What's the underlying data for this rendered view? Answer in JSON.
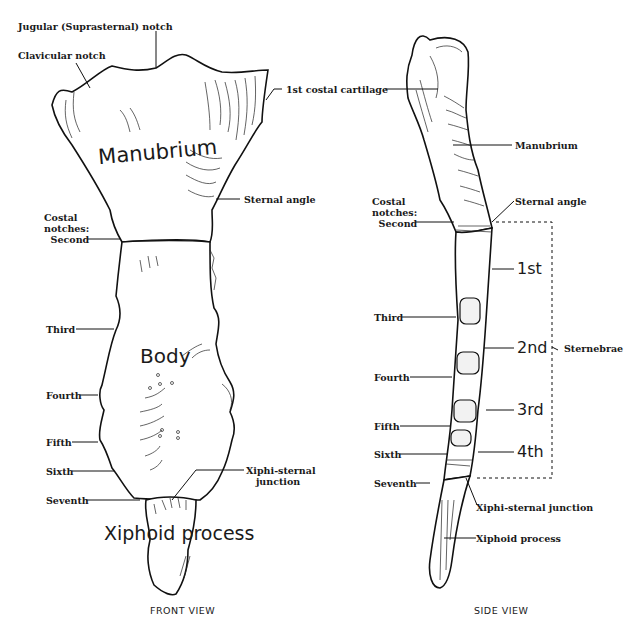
{
  "front_view": {
    "caption": "FRONT VIEW",
    "regions": {
      "manubrium": "Manubrium",
      "body": "Body",
      "xiphoid": "Xiphoid process"
    },
    "labels": {
      "jugular_notch": "Jugular (Suprasternal) notch",
      "clavicular_notch": "Clavicular notch",
      "first_costal_cartilage": "1st costal cartilage",
      "sternal_angle": "Sternal angle",
      "costal_notches": "Costal\nnotches:\n  Second",
      "third": "Third",
      "fourth": "Fourth",
      "fifth": "Fifth",
      "sixth": "Sixth",
      "seventh": "Seventh",
      "xiphisternal_junction": "Xiphi-sternal\n   junction"
    }
  },
  "side_view": {
    "caption": "SIDE VIEW",
    "labels": {
      "manubrium": "Manubrium",
      "sternal_angle": "Sternal angle",
      "costal_notches": "Costal\nnotches:\n  Second",
      "third": "Third",
      "fourth": "Fourth",
      "fifth": "Fifth",
      "sixth": "Sixth",
      "seventh": "Seventh",
      "xiphisternal_junction": "Xiphi-sternal junction",
      "xiphoid_process": "Xiphoid process",
      "sternebrae": "Sternebrae"
    },
    "sternebrae": [
      "1st",
      "2nd",
      "3rd",
      "4th"
    ]
  }
}
